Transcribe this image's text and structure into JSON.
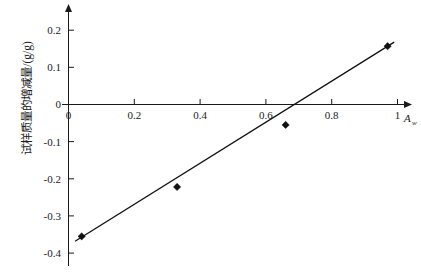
{
  "chart_data": {
    "type": "scatter",
    "title": "",
    "subtitle": "",
    "xlabel": "A",
    "xlabel_subscript": "w",
    "ylabel": "试样质量的增减量/(g/g)",
    "xlim": [
      -0.04,
      1.08
    ],
    "ylim": [
      -0.42,
      0.25
    ],
    "grid": false,
    "legend": "none",
    "xticks": [
      "0",
      "0.2",
      "0.4",
      "0.6",
      "0.8",
      "1"
    ],
    "xtick_values": [
      0,
      0.2,
      0.4,
      0.6,
      0.8,
      1
    ],
    "yticks": [
      "0.2",
      "0.1",
      "0",
      "-0.1",
      "-0.2",
      "-0.3",
      "-0.4"
    ],
    "ytick_values": [
      0.2,
      0.1,
      0,
      -0.1,
      -0.2,
      -0.3,
      -0.4
    ],
    "series": [
      {
        "name": "测量点",
        "marker": "diamond",
        "color": "#111111",
        "x": [
          0.04,
          0.33,
          0.66,
          0.97
        ],
        "y": [
          -0.355,
          -0.222,
          -0.055,
          0.157
        ]
      },
      {
        "name": "拟合直线",
        "type": "line",
        "color": "#111111",
        "x": [
          0.02,
          0.99
        ],
        "y": [
          -0.368,
          0.168
        ],
        "zero_crossing_x": 0.7
      }
    ],
    "annotations": []
  },
  "figure": {
    "x_axis_name": "axis-x",
    "y_axis_name": "axis-y",
    "background": "#ffffff",
    "axis_color": "#1a1a1a",
    "data_color": "#111111"
  }
}
